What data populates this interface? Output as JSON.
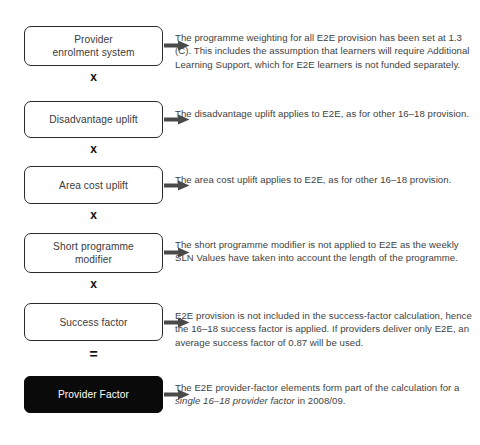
{
  "diagram": {
    "accent_color": "#4a4a4a",
    "box_border_color": "#2b2b2b",
    "filled_box_color": "#0a0a0a",
    "text_color": "#3f3f3f",
    "steps": [
      {
        "id": "provider-enrolment-system",
        "label": "Provider\nenrolment system",
        "operator_after": "x",
        "note": "The programme weighting for all E2E provision has been set at 1.3 (C). This includes the assumption that learners will require Additional Learning Support, which for E2E learners is not funded separately.",
        "note_italic": "",
        "note_tail": "",
        "filled": false
      },
      {
        "id": "disadvantage-uplift",
        "label": "Disadvantage uplift",
        "operator_after": "x",
        "note": "The disadvantage uplift applies to E2E, as for other 16–18 provision.",
        "note_italic": "",
        "note_tail": "",
        "filled": false
      },
      {
        "id": "area-cost-uplift",
        "label": "Area cost uplift",
        "operator_after": "x",
        "note": "The area cost uplift applies to E2E, as for other 16–18 provision.",
        "note_italic": "",
        "note_tail": "",
        "filled": false
      },
      {
        "id": "short-programme-modifier",
        "label": "Short programme\nmodifier",
        "operator_after": "x",
        "note": "The short programme modifier is not applied to E2E as the weekly SLN Values have taken into account the length of the programme.",
        "note_italic": "",
        "note_tail": "",
        "filled": false
      },
      {
        "id": "success-factor",
        "label": "Success factor",
        "operator_after": "=",
        "note": "E2E provision is not included in the success-factor calculation, hence the 16–18 success factor is applied. If providers deliver only E2E, an average success factor of 0.87 will be used.",
        "note_italic": "",
        "note_tail": "",
        "filled": false
      },
      {
        "id": "provider-factor",
        "label": "Provider Factor",
        "operator_after": "",
        "note": "The E2E provider-factor elements form part of the calculation for a ",
        "note_italic": "single 16–18 provider factor",
        "note_tail": " in 2008/09.",
        "filled": true
      }
    ]
  }
}
